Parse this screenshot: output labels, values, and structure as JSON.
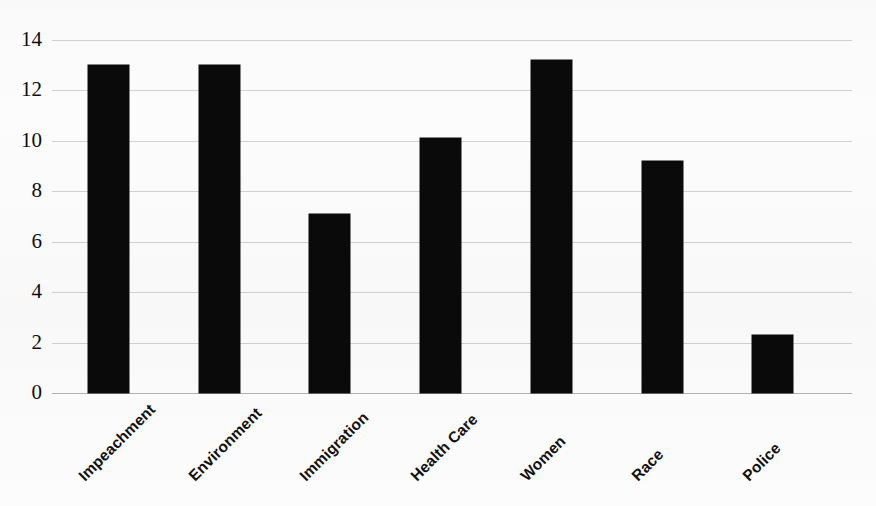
{
  "chart_data": {
    "type": "bar",
    "title": "",
    "subtitle": "",
    "xlabel": "",
    "ylabel": "",
    "categories": [
      "Impeachment",
      "Environment",
      "Immigration",
      "Health Care",
      "Women",
      "Race",
      "Police"
    ],
    "values": [
      13.0,
      13.0,
      7.1,
      10.1,
      13.2,
      9.2,
      2.3
    ],
    "ylim": [
      0,
      14
    ],
    "yticks": [
      0,
      2,
      4,
      6,
      8,
      10,
      12,
      14
    ],
    "ytick_labels": [
      "0",
      "2",
      "4",
      "6",
      "8",
      "10",
      "12",
      "14"
    ],
    "grid": true,
    "legend": false,
    "legend_position": "none",
    "series": [
      {
        "name": "Topic frequency",
        "values": [
          13.0,
          13.0,
          7.1,
          10.1,
          13.2,
          9.2,
          2.3
        ]
      }
    ],
    "colors": {
      "bar": "#0a0a0a",
      "grid": "#d2d2d2",
      "axis": "#b3b3b3",
      "background": "#fcfcfc",
      "text": "#101010"
    }
  }
}
